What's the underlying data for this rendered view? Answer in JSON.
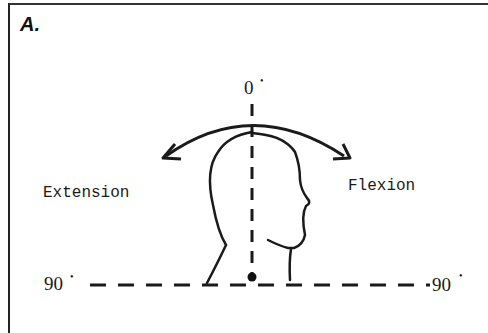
{
  "figure": {
    "panel_label": "A.",
    "labels": {
      "top_angle": "0",
      "left_angle": "90",
      "right_angle": "90",
      "degree_symbol": "•",
      "left_motion": "Extension",
      "right_motion": "Flexion"
    },
    "colors": {
      "ink": "#1a1a1a",
      "background": "#ffffff"
    },
    "icons": {
      "arc_arrow": "double-headed-curved-arrow",
      "head": "head-profile-outline",
      "pivot": "pivot-dot"
    }
  }
}
